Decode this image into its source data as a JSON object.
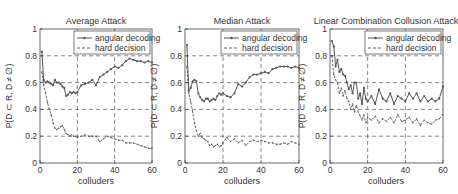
{
  "figure": {
    "panels": [
      {
        "title": "Average Attack",
        "xlabel": "colluders",
        "ylabel": "P(D ⊂ R, D ≠ ∅)"
      },
      {
        "title": "Median Attack",
        "xlabel": "colluders",
        "ylabel": "P(D ⊂ R, D ≠ ∅)"
      },
      {
        "title": "Linear Combination Collusion Attack",
        "xlabel": "colluders",
        "ylabel": "P(D ⊂ R, D ≠ ∅)"
      }
    ],
    "legend": {
      "series1": "angular decoding",
      "series2": "hard decision"
    },
    "xticks": [
      "0",
      "20",
      "40",
      "60"
    ],
    "yticks": [
      "0",
      "0.2",
      "0.4",
      "0.6",
      "0.8",
      "1"
    ],
    "colors": {
      "line": "#555555",
      "grid": "#555555",
      "axis": "#444444"
    }
  },
  "chart_data": [
    {
      "type": "line",
      "title": "Average Attack",
      "xlabel": "colluders",
      "ylabel": "P(D ⊂ R, D ≠ ∅)",
      "xlim": [
        0,
        60
      ],
      "ylim": [
        0,
        1
      ],
      "grid": true,
      "legend_position": "top-right",
      "x": [
        1,
        2,
        3,
        4,
        5,
        6,
        7,
        8,
        9,
        10,
        11,
        12,
        13,
        14,
        15,
        16,
        17,
        18,
        19,
        20,
        22,
        24,
        26,
        28,
        30,
        32,
        34,
        36,
        38,
        40,
        42,
        44,
        46,
        48,
        50,
        52,
        54,
        56,
        58,
        60
      ],
      "series": [
        {
          "name": "angular decoding",
          "style": "solid-dot",
          "values": [
            0.83,
            0.62,
            0.6,
            0.61,
            0.6,
            0.59,
            0.58,
            0.62,
            0.6,
            0.6,
            0.59,
            0.57,
            0.56,
            0.5,
            0.51,
            0.53,
            0.52,
            0.53,
            0.52,
            0.53,
            0.58,
            0.59,
            0.6,
            0.62,
            0.58,
            0.64,
            0.66,
            0.68,
            0.7,
            0.72,
            0.71,
            0.73,
            0.76,
            0.78,
            0.77,
            0.76,
            0.76,
            0.75,
            0.76,
            0.75
          ]
        },
        {
          "name": "hard decision",
          "style": "dashed-dot",
          "values": [
            0.68,
            0.58,
            0.52,
            0.45,
            0.4,
            0.36,
            0.3,
            0.26,
            0.25,
            0.26,
            0.27,
            0.28,
            0.25,
            0.22,
            0.21,
            0.2,
            0.21,
            0.2,
            0.2,
            0.19,
            0.2,
            0.21,
            0.2,
            0.2,
            0.2,
            0.16,
            0.18,
            0.2,
            0.19,
            0.18,
            0.17,
            0.17,
            0.15,
            0.15,
            0.15,
            0.14,
            0.13,
            0.12,
            0.11,
            0.11
          ]
        }
      ]
    },
    {
      "type": "line",
      "title": "Median Attack",
      "xlabel": "colluders",
      "ylabel": "P(D ⊂ R, D ≠ ∅)",
      "xlim": [
        0,
        60
      ],
      "ylim": [
        0,
        1
      ],
      "grid": true,
      "legend_position": "top-right",
      "x": [
        1,
        2,
        3,
        4,
        5,
        6,
        7,
        8,
        9,
        10,
        11,
        12,
        13,
        14,
        15,
        16,
        17,
        18,
        19,
        20,
        22,
        24,
        26,
        28,
        30,
        32,
        34,
        36,
        38,
        40,
        42,
        44,
        46,
        48,
        50,
        52,
        54,
        56,
        58,
        60
      ],
      "series": [
        {
          "name": "angular decoding",
          "style": "solid-dot",
          "values": [
            0.88,
            0.54,
            0.56,
            0.61,
            0.62,
            0.61,
            0.52,
            0.49,
            0.47,
            0.46,
            0.48,
            0.48,
            0.46,
            0.47,
            0.48,
            0.47,
            0.5,
            0.52,
            0.51,
            0.52,
            0.5,
            0.49,
            0.52,
            0.59,
            0.57,
            0.6,
            0.64,
            0.66,
            0.66,
            0.67,
            0.68,
            0.67,
            0.7,
            0.71,
            0.72,
            0.72,
            0.72,
            0.71,
            0.72,
            0.71
          ]
        },
        {
          "name": "hard decision",
          "style": "dashed-dot",
          "values": [
            0.72,
            0.52,
            0.46,
            0.38,
            0.3,
            0.24,
            0.2,
            0.22,
            0.19,
            0.18,
            0.17,
            0.16,
            0.13,
            0.14,
            0.12,
            0.13,
            0.14,
            0.12,
            0.13,
            0.15,
            0.19,
            0.16,
            0.18,
            0.15,
            0.17,
            0.13,
            0.16,
            0.17,
            0.16,
            0.17,
            0.16,
            0.15,
            0.15,
            0.14,
            0.14,
            0.15,
            0.14,
            0.16,
            0.15,
            0.14
          ]
        }
      ]
    },
    {
      "type": "line",
      "title": "Linear Combination Collusion Attack",
      "xlabel": "colluders",
      "ylabel": "P(D ⊂ R, D ≠ ∅)",
      "xlim": [
        0,
        60
      ],
      "ylim": [
        0,
        1
      ],
      "grid": true,
      "legend_position": "top-right",
      "x": [
        1,
        2,
        3,
        4,
        5,
        6,
        7,
        8,
        9,
        10,
        11,
        12,
        13,
        14,
        15,
        16,
        17,
        18,
        19,
        20,
        22,
        24,
        26,
        28,
        30,
        32,
        34,
        36,
        38,
        40,
        42,
        44,
        46,
        48,
        50,
        52,
        54,
        56,
        58,
        60
      ],
      "series": [
        {
          "name": "angular decoding",
          "style": "solid-dot",
          "values": [
            0.91,
            0.87,
            0.72,
            0.77,
            0.68,
            0.7,
            0.66,
            0.65,
            0.6,
            0.55,
            0.58,
            0.52,
            0.6,
            0.6,
            0.48,
            0.52,
            0.44,
            0.56,
            0.48,
            0.46,
            0.5,
            0.44,
            0.55,
            0.48,
            0.46,
            0.52,
            0.44,
            0.5,
            0.48,
            0.46,
            0.52,
            0.48,
            0.52,
            0.46,
            0.5,
            0.46,
            0.48,
            0.46,
            0.48,
            0.57
          ]
        },
        {
          "name": "hard decision",
          "style": "dashed-dot",
          "values": [
            0.8,
            0.66,
            0.62,
            0.6,
            0.52,
            0.56,
            0.5,
            0.54,
            0.48,
            0.46,
            0.4,
            0.44,
            0.38,
            0.43,
            0.38,
            0.35,
            0.32,
            0.36,
            0.3,
            0.34,
            0.32,
            0.35,
            0.3,
            0.33,
            0.31,
            0.34,
            0.3,
            0.36,
            0.31,
            0.32,
            0.34,
            0.3,
            0.33,
            0.28,
            0.32,
            0.3,
            0.29,
            0.32,
            0.33,
            0.36
          ]
        }
      ]
    }
  ]
}
